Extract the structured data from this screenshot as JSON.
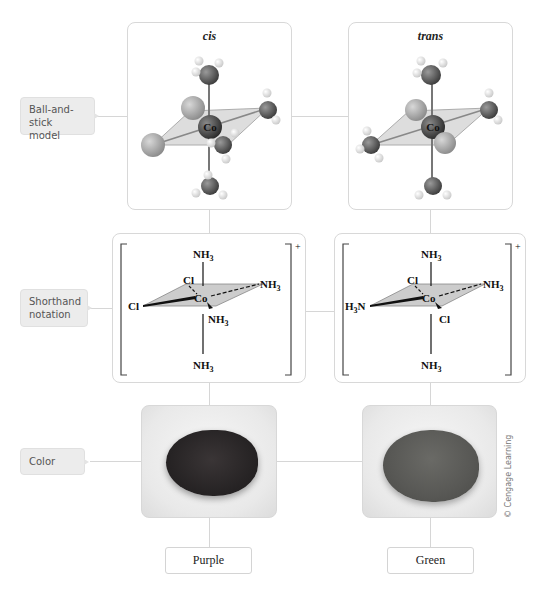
{
  "row_labels": {
    "ball_and_stick": "Ball-and-stick model",
    "shorthand": "Shorthand notation",
    "color": "Color"
  },
  "isomers": [
    {
      "name": "cis",
      "center_atom": "Co",
      "shorthand": {
        "top": "NH3",
        "bottom": "NH3",
        "back_left": "Cl",
        "back_right": "NH3",
        "front_left": "Cl",
        "front_right": "NH3",
        "charge": "+"
      },
      "color_label": "Purple",
      "powder_color": "#2a2628"
    },
    {
      "name": "trans",
      "center_atom": "Co",
      "shorthand": {
        "top": "NH3",
        "bottom": "NH3",
        "back_left": "Cl",
        "back_right": "NH3",
        "front_left": "H3N",
        "front_right": "Cl",
        "charge": "+"
      },
      "color_label": "Green",
      "powder_color": "#555553"
    }
  ],
  "credit": "© Cengage Learning"
}
